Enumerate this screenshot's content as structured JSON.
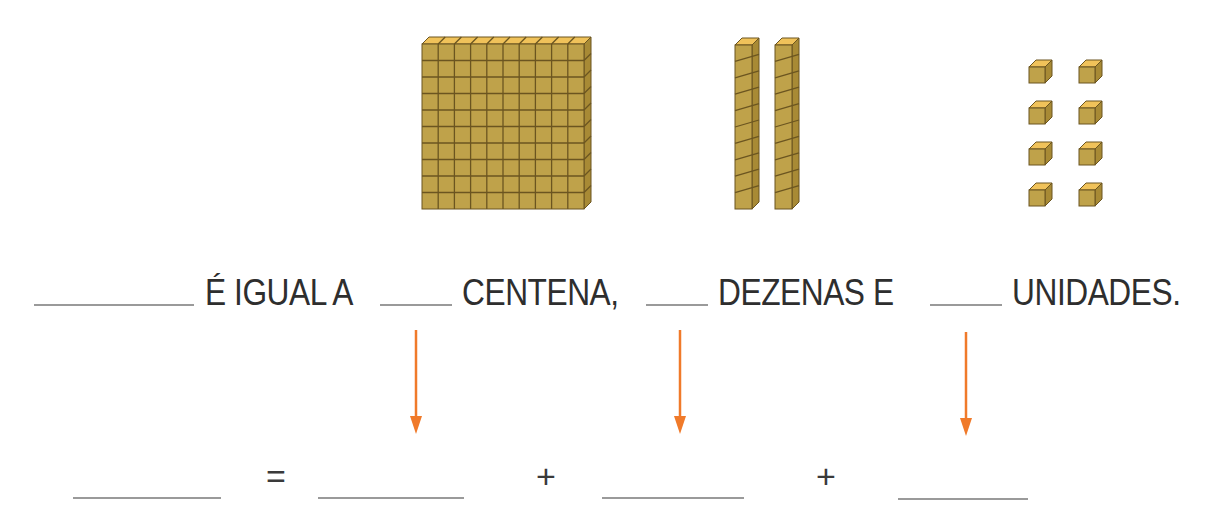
{
  "figure": {
    "blocks": {
      "hundreds": {
        "count": 1,
        "label": "placa de centena",
        "grid": "10x10"
      },
      "tens": {
        "count": 2,
        "label": "barras de dezena",
        "units_per_bar": 10
      },
      "units": {
        "count": 8,
        "label": "cubinhos de unidade",
        "layout": "4 rows x 2 cols"
      }
    },
    "colors": {
      "block_face": "#bfa24a",
      "block_top": "#f0c25a",
      "block_side": "#a88a35",
      "grid_line": "#6b5520",
      "arrow": "#f07a2a",
      "blank_line": "#9a9a9a"
    }
  },
  "sentence": {
    "blank_1": "",
    "part_1": "É IGUAL A",
    "blank_2": "",
    "part_2": "CENTENA,",
    "blank_3": "",
    "part_3": "DEZENAS E",
    "blank_4": "",
    "part_4": "UNIDADES."
  },
  "equation": {
    "total": "",
    "equals": "=",
    "hundreds_value": "",
    "plus_1": "+",
    "tens_value": "",
    "plus_2": "+",
    "units_value": ""
  },
  "arrows": [
    {
      "from": "centena",
      "to": "hundreds_value"
    },
    {
      "from": "dezenas",
      "to": "tens_value"
    },
    {
      "from": "unidades",
      "to": "units_value"
    }
  ]
}
